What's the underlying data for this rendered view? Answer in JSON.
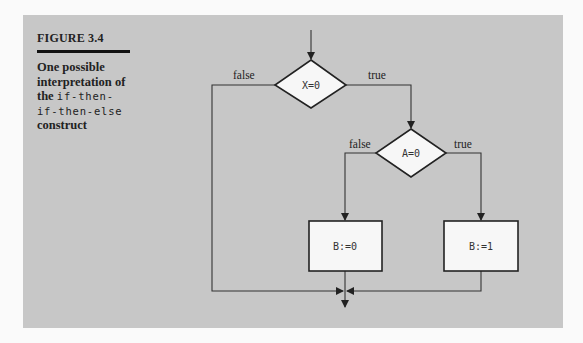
{
  "figure": {
    "number_label": "FIGURE 3.4",
    "caption_prefix": "One possible interpretation of the ",
    "caption_code": "if-then-if-then-else",
    "caption_suffix": " construct",
    "caption_lines": {
      "line1": "One possible",
      "line2": "interpretation of",
      "line3_text": "the ",
      "line3_code": "if-then-",
      "line4_code": "if-then-else",
      "line5": "construct"
    }
  },
  "diagram": {
    "nodes": [
      {
        "id": "decision-x",
        "type": "diamond",
        "label": "X=0"
      },
      {
        "id": "decision-a",
        "type": "diamond",
        "label": "A=0"
      },
      {
        "id": "process-b0",
        "type": "box",
        "label": "B:=0"
      },
      {
        "id": "process-b1",
        "type": "box",
        "label": "B:=1"
      }
    ],
    "edge_labels": {
      "x_false": "false",
      "x_true": "true",
      "a_false": "false",
      "a_true": "true"
    }
  }
}
